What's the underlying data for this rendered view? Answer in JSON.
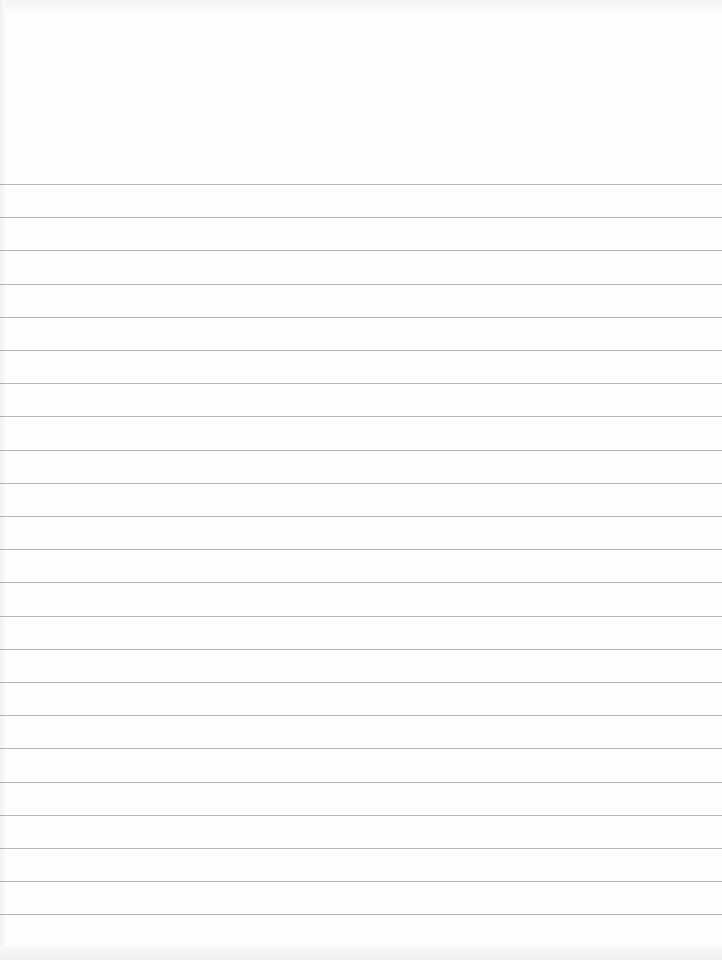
{
  "page": {
    "type": "lined-notebook-paper",
    "background_color": "#fdfdfd",
    "line_color": "#b5b5b5",
    "first_line_y": 184,
    "line_spacing": 33.2,
    "line_count": 24
  }
}
